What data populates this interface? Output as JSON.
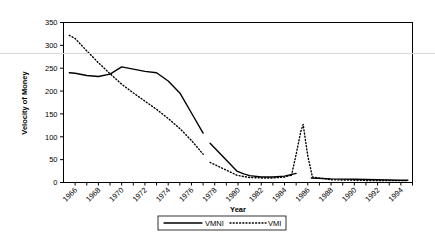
{
  "chart_data": {
    "type": "line",
    "title": "",
    "xlabel": "Year",
    "ylabel": "Velocity of Money",
    "xlim": [
      1965,
      1995
    ],
    "ylim": [
      0,
      350
    ],
    "grid": false,
    "legend_position": "bottom",
    "y_ticks": [
      0,
      50,
      100,
      150,
      200,
      250,
      300,
      350
    ],
    "x_ticks": [
      1966,
      1968,
      1970,
      1972,
      1974,
      1976,
      1978,
      1980,
      1982,
      1984,
      1986,
      1988,
      1990,
      1992,
      1994
    ],
    "x_tick_labels": [
      "1966",
      "1968",
      "1970",
      "1972",
      "1974",
      "1976",
      "1978",
      "1980",
      "1982",
      "1984",
      "1986",
      "1988",
      "1990",
      "1992",
      "1994"
    ],
    "y_tick_labels": [
      "0",
      "50",
      "100",
      "150",
      "200",
      "250",
      "300",
      "350"
    ],
    "series": [
      {
        "name": "VMNI",
        "style": "solid",
        "color": "#000000",
        "segments": [
          {
            "x": [
              1965.5,
              1966,
              1967,
              1968,
              1969,
              1970,
              1971,
              1972,
              1973,
              1974,
              1975,
              1976,
              1977
            ],
            "y": [
              240,
              239,
              234,
              232,
              237,
              253,
              248,
              243,
              240,
              222,
              196,
              152,
              108
            ]
          },
          {
            "x": [
              1977.6,
              1979.9,
              1980.5,
              1981,
              1982,
              1983,
              1984,
              1985
            ],
            "y": [
              86,
              25,
              19,
              15,
              12,
              12,
              14,
              20
            ]
          },
          {
            "x": [
              1986.3,
              1988,
              1990,
              1992,
              1994,
              1994.6
            ],
            "y": [
              10,
              8,
              7,
              6,
              5,
              5
            ]
          }
        ]
      },
      {
        "name": "VMI",
        "style": "dotted",
        "color": "#000000",
        "segments": [
          {
            "x": [
              1965.5,
              1966,
              1967,
              1968,
              1969,
              1970,
              1971,
              1972,
              1973,
              1974,
              1975,
              1976,
              1977
            ],
            "y": [
              322,
              315,
              288,
              262,
              238,
              215,
              196,
              178,
              160,
              140,
              118,
              92,
              62
            ]
          },
          {
            "x": [
              1977.6,
              1979.9,
              1980.5,
              1981,
              1982,
              1983,
              1984,
              1984.6
            ],
            "y": [
              44,
              16,
              13,
              11,
              10,
              10,
              12,
              16
            ]
          },
          {
            "x": [
              1984.6,
              1985,
              1985.4,
              1985.6,
              1986,
              1986.4
            ],
            "y": [
              16,
              62,
              112,
              127,
              58,
              12
            ]
          },
          {
            "x": [
              1986.4,
              1988,
              1990,
              1992,
              1994,
              1994.6
            ],
            "y": [
              12,
              6,
              5,
              4,
              4,
              4
            ]
          }
        ]
      }
    ],
    "legend_entries": [
      {
        "label": "VMNI",
        "style": "solid"
      },
      {
        "label": "VMI",
        "style": "dotted"
      }
    ]
  }
}
